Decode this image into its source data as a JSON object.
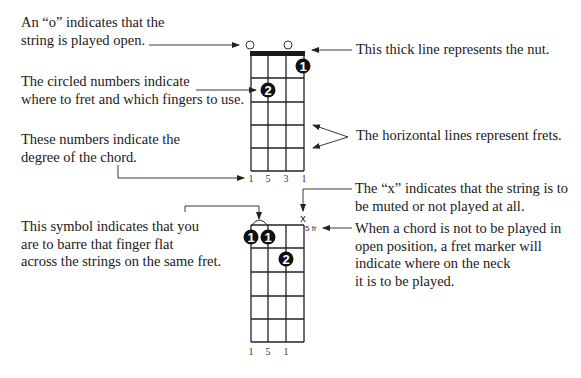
{
  "annotations": {
    "open_string": [
      "An “o” indicates that the",
      "string is played open."
    ],
    "nut": [
      "This thick line represents the nut."
    ],
    "finger_numbers": [
      "The circled numbers indicate",
      "where to fret and which fingers to use."
    ],
    "frets": [
      "The horizontal lines represent frets."
    ],
    "degrees": [
      "These numbers indicate the",
      "degree of the chord."
    ],
    "muted": [
      "The “x” indicates that the string is to",
      "be muted or not played at all."
    ],
    "barre": [
      "This symbol indicates that you",
      "are to barre that finger flat",
      "across the strings on the same fret."
    ],
    "fret_marker": [
      "When a chord is not to be played in",
      "open position, a fret marker will",
      "indicate where on the neck",
      "it is to be played."
    ]
  },
  "chord_top": {
    "strings": 4,
    "frets": 5,
    "open_markers": [
      "o",
      "o"
    ],
    "fingers": [
      {
        "number": "1",
        "string": 4,
        "fret": 1
      },
      {
        "number": "2",
        "string": 2,
        "fret": 2
      }
    ],
    "degrees": [
      "1",
      "5",
      "3",
      "1"
    ]
  },
  "chord_bottom": {
    "strings": 4,
    "frets": 5,
    "muted_marker": "x",
    "fret_marker": "5 fr",
    "fingers": [
      {
        "number": "1",
        "string": 1,
        "fret": 1
      },
      {
        "number": "1",
        "string": 2,
        "fret": 1
      },
      {
        "number": "2",
        "string": 3,
        "fret": 2
      }
    ],
    "degrees": [
      "1",
      "5",
      "1"
    ]
  }
}
